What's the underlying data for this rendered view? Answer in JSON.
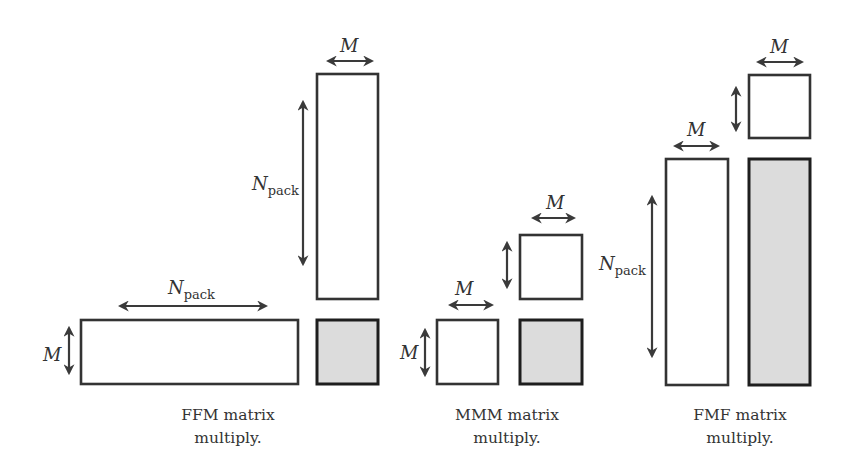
{
  "diagram": {
    "labels": {
      "m": "M",
      "n": "N",
      "pack": "pack"
    },
    "panels": [
      {
        "id": "ffm",
        "caption_line1": "FFM matrix",
        "caption_line2": "multiply."
      },
      {
        "id": "mmm",
        "caption_line1": "MMM matrix",
        "caption_line2": "multiply."
      },
      {
        "id": "fmf",
        "caption_line1": "FMF matrix",
        "caption_line2": "multiply."
      }
    ],
    "colors": {
      "stroke": "#333333",
      "result_fill": "#dcdcdc",
      "background": "#ffffff"
    }
  }
}
